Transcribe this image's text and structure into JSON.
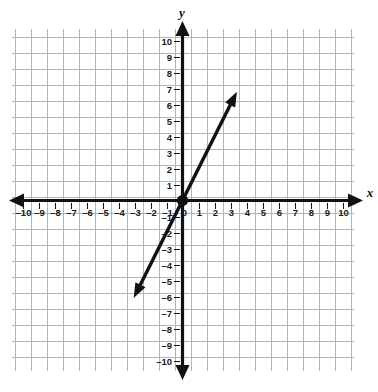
{
  "figure": {
    "kind": "coordinate-plane",
    "background_color": "#ffffff",
    "grid_color": "#b5b5b5",
    "axis_color": "#111111",
    "line_color": "#111111",
    "x_axis_name": "x",
    "y_axis_name": "y"
  },
  "chart_data": {
    "type": "line",
    "title": "",
    "subtitle": "",
    "xlabel": "x",
    "ylabel": "y",
    "xlim": [
      -10,
      10
    ],
    "ylim": [
      -10,
      10
    ],
    "grid": true,
    "legend": "none",
    "x_tick_labels": [
      "-10",
      "-9",
      "-8",
      "-7",
      "-6",
      "-5",
      "-4",
      "-3",
      "-2",
      "-1",
      "0",
      "1",
      "2",
      "3",
      "4",
      "5",
      "6",
      "7",
      "8",
      "9",
      "10"
    ],
    "x_tick_values": [
      -10,
      -9,
      -8,
      -7,
      -6,
      -5,
      -4,
      -3,
      -2,
      -1,
      0,
      1,
      2,
      3,
      4,
      5,
      6,
      7,
      8,
      9,
      10
    ],
    "y_tick_labels": [
      "-10",
      "-9",
      "-8",
      "-7",
      "-6",
      "-5",
      "-4",
      "-3",
      "-2",
      "-1",
      "1",
      "2",
      "3",
      "4",
      "5",
      "6",
      "7",
      "8",
      "9",
      "10"
    ],
    "y_tick_values": [
      -10,
      -9,
      -8,
      -7,
      -6,
      -5,
      -4,
      -3,
      -2,
      -1,
      1,
      2,
      3,
      4,
      5,
      6,
      7,
      8,
      9,
      10
    ],
    "series": [
      {
        "name": "y = 2x",
        "equation": "y = 2x",
        "slope": 2,
        "y_intercept": 0,
        "arrows": "both",
        "x": [
          -3.05,
          3.4
        ],
        "values": [
          -6.1,
          6.8
        ],
        "endpoints": [
          {
            "x": -3.05,
            "y": -6.1
          },
          {
            "x": 3.4,
            "y": 6.8
          }
        ],
        "marked_points": [
          {
            "x": 0,
            "y": 0,
            "style": "filled-dot"
          }
        ]
      }
    ]
  }
}
